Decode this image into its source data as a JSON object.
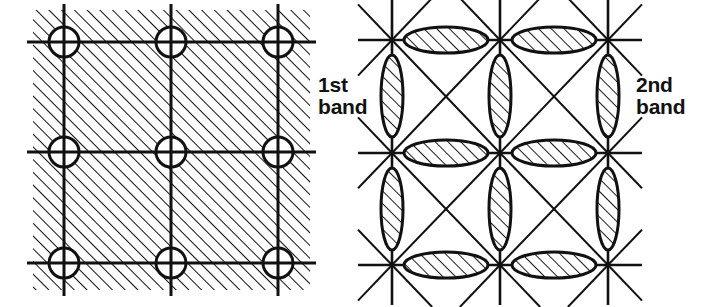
{
  "figure": {
    "background_color": "#ffffff",
    "ink_color": "#111111",
    "width": 728,
    "height": 307
  },
  "panels": [
    {
      "id": "first-band",
      "label": "1st\nband",
      "label_line1": "1st",
      "label_line2": "band",
      "label_x": 318,
      "label_y": 92,
      "description": "First Brillouin zone band: hatched occupied region of a square reciprocal lattice with unfilled circular pockets at each lattice point.",
      "region": {
        "x": 33,
        "y": 10,
        "width": 277,
        "height": 280
      },
      "hatch": {
        "angle_deg": 45,
        "spacing": 9,
        "stroke_width": 2.0,
        "direction": "bottom-left-to-top-right"
      },
      "grid": {
        "x_lines": [
          64,
          171,
          278
        ],
        "y_lines": [
          42,
          152,
          263
        ],
        "stroke_width": 3.0,
        "extend": 16
      },
      "circles": {
        "radius": 15,
        "stroke_width": 3.0,
        "fill": "#ffffff",
        "centers": [
          {
            "x": 64,
            "y": 42
          },
          {
            "x": 171,
            "y": 42
          },
          {
            "x": 278,
            "y": 42
          },
          {
            "x": 64,
            "y": 152
          },
          {
            "x": 171,
            "y": 152
          },
          {
            "x": 278,
            "y": 152
          },
          {
            "x": 64,
            "y": 263
          },
          {
            "x": 171,
            "y": 263
          },
          {
            "x": 278,
            "y": 263
          }
        ]
      }
    },
    {
      "id": "second-band",
      "label": "2nd\nband",
      "label_line1": "2nd",
      "label_line2": "band",
      "label_x": 636,
      "label_y": 92,
      "description": "Second Brillouin zone band: lens-shaped hatched occupied pockets straddling the zone boundaries of a square reciprocal lattice with diagonals.",
      "region": {
        "x": 370,
        "y": 10,
        "width": 260,
        "height": 285
      },
      "grid": {
        "x_lines": [
          392,
          500,
          608
        ],
        "y_lines": [
          40,
          153,
          265
        ],
        "stroke_width": 2.6,
        "extend": 30,
        "diagonals": true,
        "diagonal_stroke_width": 2.0
      },
      "lenses": {
        "stroke_width": 3.0,
        "fill": "#ffffff",
        "hatch_spacing": 9,
        "hatch_stroke_width": 1.8,
        "hatch_angle_deg": 45,
        "horizontal": {
          "rx": 42,
          "ry": 13
        },
        "vertical": {
          "rx": 11,
          "ry": 41
        },
        "horizontal_centers": [
          {
            "x": 446,
            "y": 40
          },
          {
            "x": 554,
            "y": 40
          },
          {
            "x": 446,
            "y": 153
          },
          {
            "x": 554,
            "y": 153
          },
          {
            "x": 446,
            "y": 265
          },
          {
            "x": 554,
            "y": 265
          }
        ],
        "vertical_centers": [
          {
            "x": 392,
            "y": 96
          },
          {
            "x": 500,
            "y": 96
          },
          {
            "x": 608,
            "y": 96
          },
          {
            "x": 392,
            "y": 209
          },
          {
            "x": 500,
            "y": 209
          },
          {
            "x": 608,
            "y": 209
          }
        ],
        "edge_horizontal_centers": [],
        "edge_vertical_centers": []
      }
    }
  ]
}
